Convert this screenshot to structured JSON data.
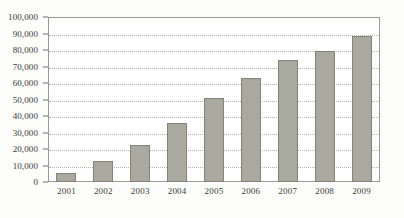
{
  "chart_data": {
    "type": "bar",
    "title": "",
    "subtitle": "",
    "xlabel": "",
    "ylabel": "",
    "categories": [
      "2001",
      "2002",
      "2003",
      "2004",
      "2005",
      "2006",
      "2007",
      "2008",
      "2009"
    ],
    "values": [
      5500,
      12500,
      22500,
      36000,
      51000,
      63000,
      74000,
      79500,
      88500
    ],
    "ylim": [
      0,
      100000
    ],
    "ytick_values": [
      0,
      10000,
      20000,
      30000,
      40000,
      50000,
      60000,
      70000,
      80000,
      90000,
      100000
    ],
    "ytick_labels": [
      "0",
      "10,000",
      "20,000",
      "30,000",
      "40,000",
      "50,000",
      "60,000",
      "70,000",
      "80,000",
      "90,000",
      "100,000"
    ],
    "grid": true,
    "grid_style": "dotted-horizontal",
    "legend": false,
    "legend_position": "none",
    "bar_fill_color": "#a9a99f",
    "bar_border_color": "#83837b",
    "grid_color": "#b4b4aa",
    "axis_color": "#9a9a92",
    "text_color": "#3b3b38",
    "background_color": "#fdfdfb",
    "plot_background_color": "#ffffff"
  }
}
